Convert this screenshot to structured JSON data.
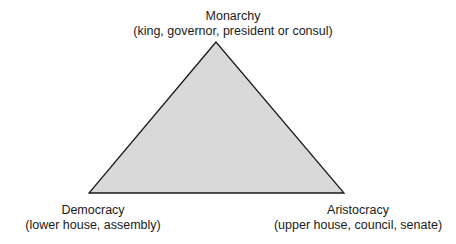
{
  "diagram": {
    "type": "triangle",
    "fill_color": "#d9d9d9",
    "stroke_color": "#1a1a1a",
    "vertices": {
      "top": {
        "title": "Monarchy",
        "subtitle": "(king, governor, president or consul)"
      },
      "bottom_left": {
        "title": "Democracy",
        "subtitle": "(lower house, assembly)"
      },
      "bottom_right": {
        "title": "Aristocracy",
        "subtitle": "(upper house, council, senate)"
      }
    }
  }
}
